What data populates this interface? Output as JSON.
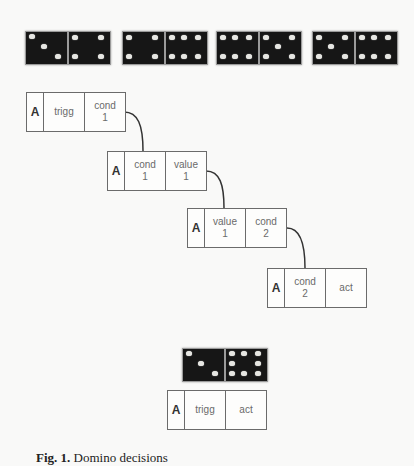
{
  "top_dominoes": [
    {
      "left": 3,
      "right": 4
    },
    {
      "left": 4,
      "right": 6
    },
    {
      "left": 6,
      "right": 5
    },
    {
      "left": 5,
      "right": 6
    }
  ],
  "chain_boxes": [
    {
      "a": "A",
      "c1": "trigg",
      "c2": "cond\n1"
    },
    {
      "a": "A",
      "c1": "cond\n1",
      "c2": "value\n1"
    },
    {
      "a": "A",
      "c1": "value\n1",
      "c2": "cond\n2"
    },
    {
      "a": "A",
      "c1": "cond\n2",
      "c2": "act"
    }
  ],
  "result_domino": {
    "left": 3,
    "right": 8
  },
  "result_box": {
    "a": "A",
    "c1": "trigg",
    "c2": "act"
  },
  "caption": {
    "label": "Fig. 1.",
    "text": "Domino decisions"
  }
}
